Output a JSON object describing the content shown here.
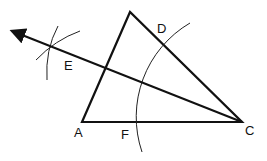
{
  "diagram": {
    "points": {
      "A": {
        "label": "A",
        "x": 82,
        "y": 122
      },
      "C": {
        "label": "C",
        "x": 242,
        "y": 122
      },
      "apex": {
        "label": "",
        "x": 130,
        "y": 12
      },
      "D": {
        "label": "D",
        "x": 160,
        "y": 42
      },
      "E": {
        "label": "E",
        "x": 55,
        "y": 64
      },
      "F": {
        "label": "F",
        "x": 133,
        "y": 122
      }
    },
    "ink_color": "#111111"
  }
}
